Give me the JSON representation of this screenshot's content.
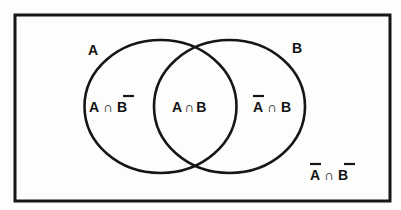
{
  "diagram": {
    "type": "venn",
    "universe": {
      "label": "",
      "stroke": "#161616",
      "fill": "#fdfdfb"
    },
    "sets": [
      {
        "id": "A",
        "label": "A"
      },
      {
        "id": "B",
        "label": "B"
      }
    ],
    "regions": [
      {
        "id": "a-only",
        "parts": [
          {
            "text": "A",
            "complement": false
          },
          {
            "text": " ∩ ",
            "complement": false
          },
          {
            "text": "B",
            "complement": true
          }
        ],
        "readable": "A ∩ B̄"
      },
      {
        "id": "intersection",
        "parts": [
          {
            "text": "A",
            "complement": false
          },
          {
            "text": "∩",
            "complement": false
          },
          {
            "text": "B",
            "complement": false
          }
        ],
        "readable": "A ∩ B"
      },
      {
        "id": "b-only",
        "parts": [
          {
            "text": "A",
            "complement": true
          },
          {
            "text": " ∩ ",
            "complement": false
          },
          {
            "text": "B",
            "complement": false
          }
        ],
        "readable": "Ā ∩ B"
      },
      {
        "id": "neither",
        "parts": [
          {
            "text": "A",
            "complement": true
          },
          {
            "text": " ∩ ",
            "complement": false
          },
          {
            "text": "B",
            "complement": true
          }
        ],
        "readable": "Ā ∩ B̄"
      }
    ],
    "colors": {
      "stroke": "#161616",
      "text": "#141414",
      "background": "#fdfdfb"
    }
  }
}
